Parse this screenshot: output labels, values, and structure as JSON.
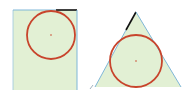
{
  "colors": {
    "background": "#ffffff",
    "fill": "#e2f0d4",
    "edge": "#7fb7d8",
    "highlight_edge": "#111111",
    "circle": "#c8442c",
    "center": "#c8442c"
  },
  "figures": [
    {
      "name": "rectangle-with-inscribed-circle",
      "shape": "rectangle",
      "circle": {
        "cx": 51,
        "cy": 35,
        "r": 24
      }
    },
    {
      "name": "triangle-with-inscribed-circle",
      "shape": "triangle",
      "circle": {
        "cx": 136,
        "cy": 61,
        "r": 26
      }
    }
  ]
}
